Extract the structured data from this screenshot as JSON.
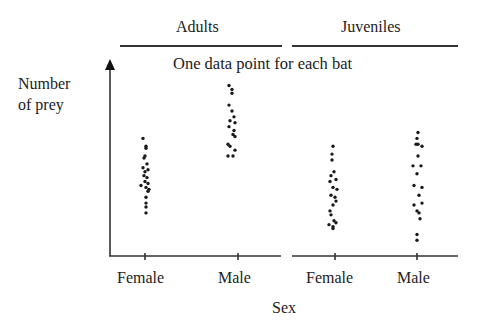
{
  "chart_data": {
    "type": "scatter",
    "title": "",
    "annotation": "One data point for each bat",
    "xlabel": "Sex",
    "ylabel": "Number of prey",
    "ylabel_lines": [
      "Number",
      "of prey"
    ],
    "y_scale": "relative (0-100, no numeric ticks shown)",
    "ylim": [
      0,
      100
    ],
    "grid": false,
    "legend": null,
    "groups": [
      {
        "name": "Adults",
        "categories": [
          "Female",
          "Male"
        ]
      },
      {
        "name": "Juveniles",
        "categories": [
          "Female",
          "Male"
        ]
      }
    ],
    "categories": [
      "Adults Female",
      "Adults Male",
      "Juveniles Female",
      "Juveniles Male"
    ],
    "series": [
      {
        "name": "Adults Female",
        "group": "Adults",
        "sex": "Female",
        "x_px": 145,
        "points": [
          {
            "dx": -2,
            "v": 60
          },
          {
            "dx": 1,
            "v": 56
          },
          {
            "dx": 1,
            "v": 55
          },
          {
            "dx": 0,
            "v": 51
          },
          {
            "dx": -1,
            "v": 50
          },
          {
            "dx": 2,
            "v": 47
          },
          {
            "dx": -2,
            "v": 45
          },
          {
            "dx": 3,
            "v": 44
          },
          {
            "dx": 0,
            "v": 43
          },
          {
            "dx": -1,
            "v": 41
          },
          {
            "dx": 2,
            "v": 40
          },
          {
            "dx": 0,
            "v": 38
          },
          {
            "dx": 3,
            "v": 37
          },
          {
            "dx": -4,
            "v": 36
          },
          {
            "dx": 1,
            "v": 35
          },
          {
            "dx": 4,
            "v": 34
          },
          {
            "dx": 3,
            "v": 33
          },
          {
            "dx": 1,
            "v": 30
          },
          {
            "dx": 1,
            "v": 27
          },
          {
            "dx": 1,
            "v": 25
          },
          {
            "dx": 1,
            "v": 22
          }
        ]
      },
      {
        "name": "Adults Male",
        "group": "Adults",
        "sex": "Male",
        "x_px": 231,
        "points": [
          {
            "dx": -2,
            "v": 87
          },
          {
            "dx": 1,
            "v": 85
          },
          {
            "dx": 1,
            "v": 83
          },
          {
            "dx": -2,
            "v": 77
          },
          {
            "dx": 1,
            "v": 74
          },
          {
            "dx": 3,
            "v": 71
          },
          {
            "dx": -1,
            "v": 69
          },
          {
            "dx": 4,
            "v": 68
          },
          {
            "dx": -2,
            "v": 66
          },
          {
            "dx": 3,
            "v": 64
          },
          {
            "dx": 2,
            "v": 62
          },
          {
            "dx": 4,
            "v": 61
          },
          {
            "dx": -3,
            "v": 57
          },
          {
            "dx": -1,
            "v": 56
          },
          {
            "dx": 4,
            "v": 54
          },
          {
            "dx": -3,
            "v": 51
          },
          {
            "dx": 2,
            "v": 51
          }
        ]
      },
      {
        "name": "Juveniles Female",
        "group": "Juveniles",
        "sex": "Female",
        "x_px": 333,
        "points": [
          {
            "dx": 0,
            "v": 56
          },
          {
            "dx": -1,
            "v": 52
          },
          {
            "dx": -1,
            "v": 49
          },
          {
            "dx": 1,
            "v": 43
          },
          {
            "dx": -2,
            "v": 41
          },
          {
            "dx": 3,
            "v": 39
          },
          {
            "dx": -3,
            "v": 38
          },
          {
            "dx": 0,
            "v": 35
          },
          {
            "dx": 4,
            "v": 34
          },
          {
            "dx": -2,
            "v": 31
          },
          {
            "dx": 2,
            "v": 30
          },
          {
            "dx": 3,
            "v": 28
          },
          {
            "dx": 0,
            "v": 26
          },
          {
            "dx": -3,
            "v": 23
          },
          {
            "dx": -2,
            "v": 21
          },
          {
            "dx": 1,
            "v": 18
          },
          {
            "dx": 3,
            "v": 17
          },
          {
            "dx": -4,
            "v": 16
          },
          {
            "dx": 0,
            "v": 15
          },
          {
            "dx": 0,
            "v": 14
          }
        ]
      },
      {
        "name": "Juveniles Male",
        "group": "Juveniles",
        "sex": "Male",
        "x_px": 418,
        "points": [
          {
            "dx": 0,
            "v": 63
          },
          {
            "dx": -1,
            "v": 60
          },
          {
            "dx": -2,
            "v": 57
          },
          {
            "dx": 0,
            "v": 57
          },
          {
            "dx": 4,
            "v": 56
          },
          {
            "dx": 0,
            "v": 51
          },
          {
            "dx": -5,
            "v": 46
          },
          {
            "dx": 3,
            "v": 46
          },
          {
            "dx": -1,
            "v": 42
          },
          {
            "dx": -4,
            "v": 36
          },
          {
            "dx": 4,
            "v": 35
          },
          {
            "dx": 1,
            "v": 31
          },
          {
            "dx": 4,
            "v": 27
          },
          {
            "dx": -4,
            "v": 26
          },
          {
            "dx": -1,
            "v": 23
          },
          {
            "dx": 1,
            "v": 22
          },
          {
            "dx": 2,
            "v": 19
          },
          {
            "dx": -1,
            "v": 11
          },
          {
            "dx": -1,
            "v": 8
          }
        ]
      }
    ],
    "layout": {
      "axis_origin_px": [
        110,
        256
      ],
      "y_axis_top_px": 60,
      "x_axis_segments_px": [
        [
          110,
          281
        ],
        [
          292,
          458
        ]
      ],
      "tick_x_px": [
        145,
        238,
        335,
        417
      ],
      "group_header_lines_px": [
        [
          120,
          282
        ],
        [
          292,
          458
        ]
      ],
      "header_line_y_px": 46
    }
  },
  "labels": {
    "group_adults": "Adults",
    "group_juveniles": "Juveniles",
    "annotation": "One data point for each bat",
    "ylabel_line1": "Number",
    "ylabel_line2": "of prey",
    "xlabel": "Sex",
    "tick_labels": [
      "Female",
      "Male",
      "Female",
      "Male"
    ]
  },
  "colors": {
    "dot": "#1a1a1a",
    "axis": "#333333",
    "text": "#222222",
    "background": "#ffffff"
  }
}
